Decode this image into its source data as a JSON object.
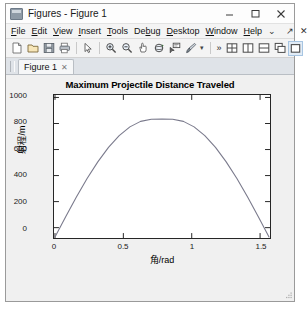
{
  "window": {
    "title": "Figures - Figure 1",
    "app_icon": "matlab-figure-icon",
    "controls": {
      "minimize": "—",
      "maximize": "□",
      "close": "✕"
    }
  },
  "menubar": {
    "items": [
      {
        "label": "File",
        "mnemonic": "F"
      },
      {
        "label": "Edit",
        "mnemonic": "E"
      },
      {
        "label": "View",
        "mnemonic": "V"
      },
      {
        "label": "Insert",
        "mnemonic": "I"
      },
      {
        "label": "Tools",
        "mnemonic": "T"
      },
      {
        "label": "Debug",
        "mnemonic": "b"
      },
      {
        "label": "Desktop",
        "mnemonic": "D"
      },
      {
        "label": "Window",
        "mnemonic": "W"
      },
      {
        "label": "Help",
        "mnemonic": "H"
      }
    ],
    "overflow": "⌄",
    "undock": "↗",
    "close": "✕"
  },
  "toolbar": {
    "buttons": [
      {
        "name": "new-figure",
        "tooltip": "New Figure"
      },
      {
        "name": "open-file",
        "tooltip": "Open File"
      },
      {
        "name": "save-figure",
        "tooltip": "Save Figure"
      },
      {
        "name": "print-figure",
        "tooltip": "Print Figure"
      },
      {
        "name": "edit-plot",
        "tooltip": "Edit Plot"
      },
      {
        "name": "zoom-in",
        "tooltip": "Zoom In"
      },
      {
        "name": "zoom-out",
        "tooltip": "Zoom Out"
      },
      {
        "name": "pan",
        "tooltip": "Pan"
      },
      {
        "name": "rotate-3d",
        "tooltip": "Rotate 3D"
      },
      {
        "name": "data-cursor",
        "tooltip": "Data Cursor"
      },
      {
        "name": "brush",
        "tooltip": "Brush/Select Data"
      }
    ],
    "brush_caret": "▾",
    "overflow": "»",
    "layout_buttons": [
      {
        "name": "tile-grid",
        "tooltip": "Tile"
      },
      {
        "name": "tile-vertical",
        "tooltip": "Left/Right"
      },
      {
        "name": "tile-horizontal",
        "tooltip": "Top/Bottom"
      },
      {
        "name": "cascade",
        "tooltip": "Cascade"
      },
      {
        "name": "single-pane",
        "tooltip": "Single",
        "selected": true
      }
    ]
  },
  "tabs": [
    {
      "label": "Figure 1",
      "close": "✕",
      "active": true
    }
  ],
  "chart_data": {
    "type": "line",
    "title": "Maximum Projectile Distance Traveled",
    "xlabel": "角/rad",
    "ylabel": "射程/m",
    "xlim": [
      0,
      1.5708
    ],
    "ylim": [
      0,
      1100
    ],
    "xticks": [
      0,
      0.5,
      1,
      1.5
    ],
    "xticklabels": [
      "0",
      "0.5",
      "1",
      "1.5"
    ],
    "yticks": [
      0,
      200,
      400,
      600,
      800,
      1000
    ],
    "yticklabels": [
      "0",
      "200",
      "400",
      "600",
      "800",
      "1000"
    ],
    "grid": false,
    "legend": null,
    "line_color": "#7a7a8c",
    "series": [
      {
        "name": "range",
        "x": [
          0,
          0.0785,
          0.1571,
          0.2356,
          0.3142,
          0.3927,
          0.4712,
          0.5498,
          0.6283,
          0.7069,
          0.7854,
          0.8639,
          0.9425,
          1.021,
          1.0996,
          1.1781,
          1.2566,
          1.3352,
          1.4137,
          1.4923,
          1.5708
        ],
        "y": [
          0,
          158,
          312,
          456,
          586,
          699,
          791,
          859,
          902,
          919,
          920,
          919,
          902,
          859,
          791,
          699,
          586,
          456,
          312,
          158,
          0
        ]
      }
    ]
  }
}
